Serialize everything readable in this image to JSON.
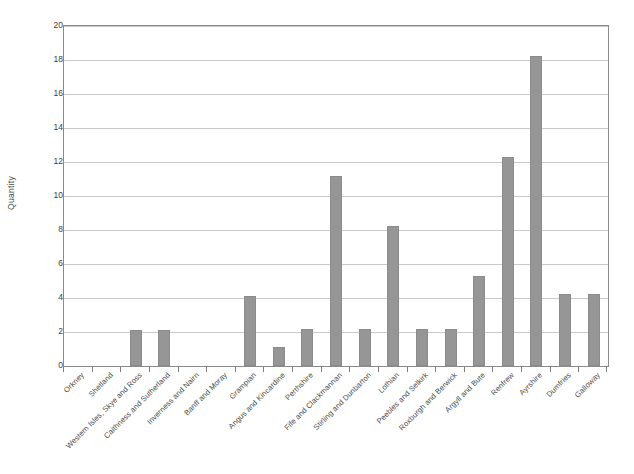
{
  "chart_data": {
    "type": "bar",
    "title": "",
    "xlabel": "",
    "ylabel": "Quantity",
    "ylim": [
      0,
      20
    ],
    "ytick_labels": [
      "0",
      "2",
      "4",
      "6",
      "8",
      "10",
      "12",
      "14",
      "16",
      "18",
      "20"
    ],
    "ytick_values": [
      0,
      2,
      4,
      6,
      8,
      10,
      12,
      14,
      16,
      18,
      20
    ],
    "grid": true,
    "legend": "none",
    "bar_color": "#969696",
    "bar_edge_color": "#8b8b8b",
    "categories": [
      "Orkney",
      "Shetland",
      "Western Isles, Skye and Ross",
      "Caithness and Sutherland",
      "Inverness and Nairn",
      "Banff and Moray",
      "Grampian",
      "Angus and Kincardine",
      "Perthshire",
      "Fife and Clackmannan",
      "Stirling and Dunbarton",
      "Lothian",
      "Peebles and Selkirk",
      "Roxburgh and Berwick",
      "Argyll and Bute",
      "Renfrew",
      "Ayrshire",
      "Dumfries",
      "Galloway"
    ],
    "values": [
      0,
      0,
      2.1,
      2.1,
      0,
      0,
      4.1,
      1.1,
      2.15,
      11.2,
      2.2,
      8.25,
      2.2,
      2.2,
      5.3,
      12.3,
      18.25,
      4.25,
      4.25
    ]
  }
}
